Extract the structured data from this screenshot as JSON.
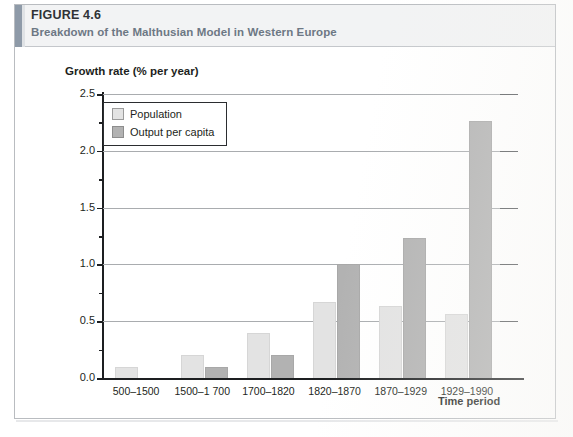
{
  "header": {
    "figure_label_prefix": "F",
    "figure_label": "FIGURE 4.6",
    "figure_label_caps": "IGURE",
    "figure_number": "4.6",
    "title": "Breakdown of the Malthusian Model in Western Europe",
    "accent_color": "#8e9aa8",
    "band_color": "#f2f3f4",
    "title_color": "#6d7884"
  },
  "chart_data": {
    "type": "bar",
    "title": "Breakdown of the Malthusian Model in Western Europe",
    "xlabel": "Time period",
    "ylabel": "Growth rate (% per year)",
    "categories": [
      "500–1500",
      "1500–1 700",
      "1700–1820",
      "1820–1870",
      "1870–1929",
      "1929–1990"
    ],
    "series": [
      {
        "name": "Population",
        "color": "#e3e3e3",
        "values": [
          0.1,
          0.2,
          0.4,
          0.67,
          0.63,
          0.56
        ]
      },
      {
        "name": "Output per capita",
        "color": "#b2b2b2",
        "values": [
          0.0,
          0.1,
          0.2,
          1.0,
          1.23,
          2.26
        ]
      }
    ],
    "ylim": [
      0.0,
      2.5
    ],
    "ytick_labels": [
      "0.0",
      "0.5",
      "1.0",
      "1.5",
      "2.0",
      "2.5"
    ],
    "ytick_values": [
      0.0,
      0.5,
      1.0,
      1.5,
      2.0,
      2.5
    ],
    "yminor_values": [
      0.25,
      0.75,
      1.25,
      1.75,
      2.25
    ],
    "grid": true,
    "legend_position": "upper-left"
  }
}
